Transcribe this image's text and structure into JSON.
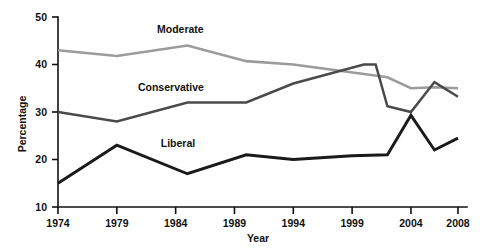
{
  "chart_data": {
    "type": "line",
    "title": "",
    "xlabel": "Year",
    "ylabel": "Percentage",
    "xlim": [
      1974,
      2008
    ],
    "ylim": [
      10,
      50
    ],
    "grid": false,
    "legend_position": "inline-labels",
    "xticks": [
      1974,
      1979,
      1984,
      1989,
      1994,
      1999,
      2004,
      2008
    ],
    "yticks": [
      10,
      20,
      30,
      40,
      50
    ],
    "series": [
      {
        "name": "Moderate",
        "color": "#9b9b9b",
        "x": [
          1974,
          1979,
          1985,
          1990,
          1994,
          1997,
          2000,
          2002,
          2004,
          2006,
          2008
        ],
        "values": [
          43.0,
          41.8,
          44.0,
          40.7,
          40.0,
          39.0,
          38.0,
          37.3,
          35.0,
          35.2,
          35.0
        ]
      },
      {
        "name": "Conservative",
        "color": "#4a4a4a",
        "x": [
          1974,
          1979,
          1985,
          1990,
          1994,
          1997,
          2000,
          2001,
          2002,
          2004,
          2006,
          2008
        ],
        "values": [
          30.0,
          28.0,
          32.0,
          32.0,
          36.0,
          38.0,
          40.0,
          40.0,
          31.2,
          30.0,
          36.3,
          33.2
        ]
      },
      {
        "name": "Liberal",
        "color": "#1a1a1a",
        "x": [
          1974,
          1979,
          1985,
          1990,
          1994,
          1999,
          2002,
          2004,
          2006,
          2008
        ],
        "values": [
          15.0,
          23.0,
          17.0,
          21.0,
          20.0,
          20.8,
          21.0,
          29.3,
          22.0,
          24.5
        ]
      }
    ],
    "series_labels": [
      {
        "text": "Moderate",
        "x": 1984.4,
        "y": 46.6
      },
      {
        "text": "Conservative",
        "x": 1983.6,
        "y": 34.4
      },
      {
        "text": "Liberal",
        "x": 1984.2,
        "y": 22.7
      }
    ]
  }
}
